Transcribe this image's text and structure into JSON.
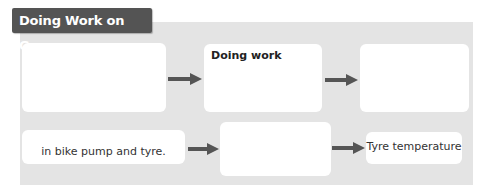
{
  "title": "Doing Work on Gases",
  "colors": {
    "title_bg": "#545454",
    "title_text": "#ffffff",
    "panel_bg": "#e4e4e4",
    "box_bg": "#ffffff",
    "arrow": "#555555"
  },
  "flow": {
    "row1": [
      {
        "text": ""
      },
      {
        "text": "Doing work"
      },
      {
        "text": ""
      }
    ],
    "row2": [
      {
        "text": "in bike pump and tyre."
      },
      {
        "text": ""
      },
      {
        "text": "Tyre temperature"
      }
    ],
    "arrow_icon": "right-arrow-icon"
  }
}
